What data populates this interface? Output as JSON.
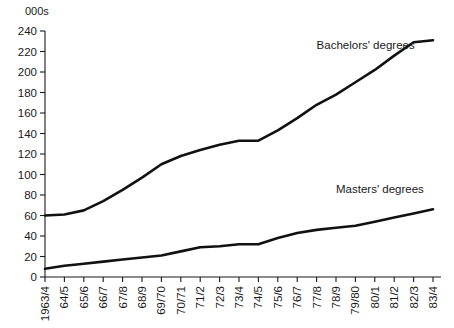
{
  "chart_data": {
    "type": "line",
    "title": "",
    "xlabel": "",
    "ylabel": "000s",
    "unit_label": "000s",
    "ylim": [
      0,
      240
    ],
    "ytick_step": 20,
    "yticks": [
      0,
      20,
      40,
      60,
      80,
      100,
      120,
      140,
      160,
      180,
      200,
      220,
      240
    ],
    "ytick_labels": [
      "0",
      "20",
      "40",
      "60",
      "80",
      "100",
      "120",
      "140",
      "160",
      "180",
      "200",
      "220",
      "240"
    ],
    "grid": false,
    "legend_position": "inline-annotation",
    "categories": [
      "1963/4",
      "64/5",
      "65/6",
      "66/7",
      "67/8",
      "68/9",
      "69/70",
      "70/71",
      "71/2",
      "72/3",
      "73/4",
      "74/5",
      "75/6",
      "76/7",
      "77/8",
      "78/9",
      "79/80",
      "80/1",
      "81/2",
      "82/3",
      "83/4"
    ],
    "series": [
      {
        "name": "Bachelors' degrees",
        "color": "#111111",
        "values": [
          60,
          61,
          65,
          74,
          85,
          97,
          110,
          118,
          124,
          129,
          133,
          133,
          143,
          155,
          168,
          178,
          190,
          202,
          216,
          229,
          231
        ]
      },
      {
        "name": "Masters' degrees",
        "color": "#111111",
        "values": [
          8,
          11,
          13,
          15,
          17,
          19,
          21,
          25,
          29,
          30,
          32,
          32,
          38,
          43,
          46,
          48,
          50,
          54,
          58,
          62,
          66
        ]
      }
    ],
    "annotations": [
      {
        "text": "Bachelors' degrees",
        "x_category": "77/8",
        "y_value": 222
      },
      {
        "text": "Masters' degrees",
        "x_category": "78/9",
        "y_value": 82
      }
    ]
  }
}
